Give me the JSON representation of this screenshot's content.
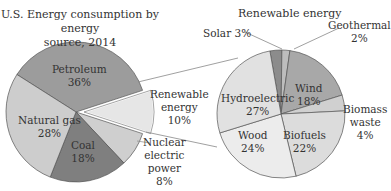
{
  "chart_data": [
    {
      "type": "pie",
      "title": "U.S. Energy consumption by energy source, 2014",
      "categories": [
        "Petroleum",
        "Renewable energy",
        "Nuclear electric power",
        "Coal",
        "Natural gas"
      ],
      "values": [
        36,
        10,
        8,
        18,
        28
      ],
      "unit": "%",
      "exploded": "Renewable energy",
      "colors": [
        "#9c9c9c",
        "#e6e6e6",
        "#cfcfcf",
        "#7f7f7f",
        "#cdcdcd"
      ]
    },
    {
      "type": "pie",
      "title": "Renewable energy",
      "categories": [
        "Solar",
        "Geothermal",
        "Wind",
        "Biomass waste",
        "Biofuels",
        "Wood",
        "Hydroelectric"
      ],
      "values": [
        3,
        2,
        18,
        4,
        22,
        24,
        27
      ],
      "unit": "%",
      "colors": [
        "#8c8c8c",
        "#bdbdbd",
        "#a8a8a8",
        "#d0d0d0",
        "#dcdcdc",
        "#ececec",
        "#e1e1e1"
      ]
    }
  ],
  "left": {
    "title_line1": "U.S. Energy consumption by energy",
    "title_line2": "source, 2014",
    "labels": {
      "petroleum": [
        "Petroleum",
        "36%"
      ],
      "natural_gas": [
        "Natural gas",
        "28%"
      ],
      "coal": [
        "Coal",
        "18%"
      ],
      "renewable": [
        "Renewable",
        "energy",
        "10%"
      ],
      "nuclear": [
        "Nuclear",
        "electric",
        "power",
        "8%"
      ]
    }
  },
  "right": {
    "title": "Renewable energy",
    "labels": {
      "solar": "Solar 3%",
      "geothermal": [
        "Geothermal",
        "2%"
      ],
      "wind": [
        "Wind",
        "18%"
      ],
      "biomass": [
        "Biomass",
        "waste",
        "4%"
      ],
      "biofuels": [
        "Biofuels",
        "22%"
      ],
      "wood": [
        "Wood",
        "24%"
      ],
      "hydro": [
        "Hydroelectric",
        "27%"
      ]
    }
  }
}
